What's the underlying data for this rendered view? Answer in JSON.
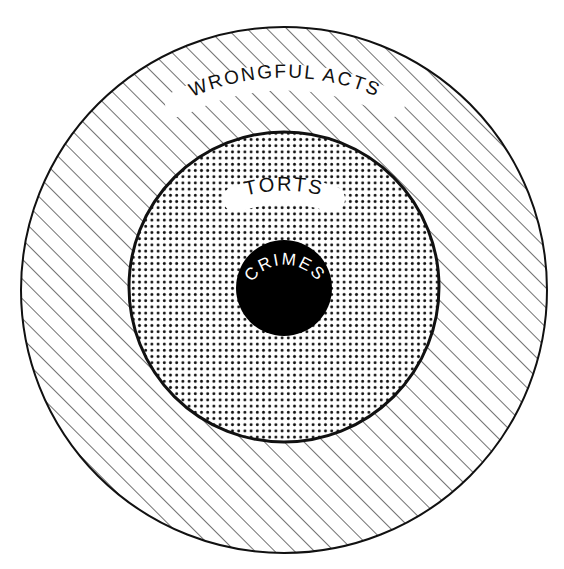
{
  "diagram": {
    "title": "",
    "type": "nested-circles",
    "colors": {
      "background": "#ffffff",
      "stroke": "#111111",
      "hatch": "#333333",
      "dots": "#111111",
      "core_fill": "#000000",
      "core_text": "#ffffff",
      "label_text": "#111111"
    },
    "circles": [
      {
        "id": "outer",
        "label": "WRONGFUL ACTS",
        "fill_pattern": "diagonal-hatch",
        "cx": 284,
        "cy": 290,
        "r": 264
      },
      {
        "id": "middle",
        "label": "TORTS",
        "fill_pattern": "dot-screen",
        "cx": 284,
        "cy": 287,
        "r": 155
      },
      {
        "id": "inner",
        "label": "CRIMES",
        "fill_pattern": "solid-black",
        "cx": 284,
        "cy": 288,
        "r": 48
      }
    ]
  }
}
